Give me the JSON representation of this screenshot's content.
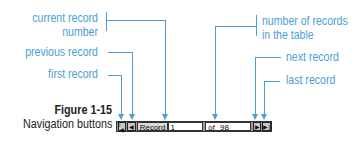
{
  "callouts": {
    "current_record_line1": "current record",
    "current_record_line2": "number",
    "previous_record": "previous record",
    "first_record": "first record",
    "num_records_line1": "number of records",
    "num_records_line2": "in the table",
    "next_record": "next record",
    "last_record": "last record"
  },
  "figure": {
    "title": "Figure 1-15",
    "caption": "Navigation buttons"
  },
  "navbar": {
    "first_icon": "first-record-icon",
    "prev_icon": "previous-record-icon",
    "record_label": "Record",
    "current_record": "1",
    "of_label": "of",
    "total_records": "98",
    "next_icon": "next-record-icon",
    "last_icon": "last-record-icon"
  },
  "colors": {
    "callout": "#4a9fd4",
    "text": "#222222"
  }
}
